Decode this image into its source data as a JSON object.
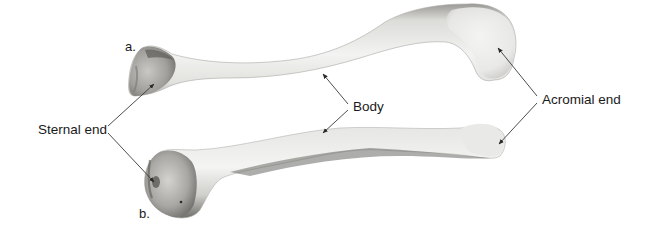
{
  "figure": {
    "panels": [
      {
        "id": "a",
        "label": "a."
      },
      {
        "id": "b",
        "label": "b."
      }
    ],
    "labels": {
      "sternal_end": "Sternal end",
      "body": "Body",
      "acromial_end": "Acromial end"
    },
    "colors": {
      "background": "#ffffff",
      "bone_light": "#f2f2f0",
      "bone_mid": "#d8d8d5",
      "bone_shadow": "#8f8f8c",
      "bone_dark": "#5a5855",
      "leader_line": "#3a3a3a",
      "text": "#1a1a1a"
    }
  }
}
